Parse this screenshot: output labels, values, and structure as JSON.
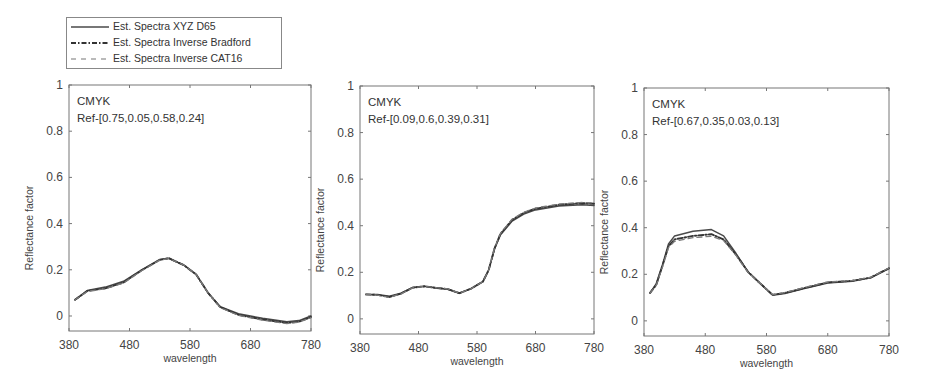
{
  "legend": {
    "entries": [
      {
        "label": "Est. Spectra XYZ D65",
        "style": "solid"
      },
      {
        "label": "Est. Spectra Inverse Bradford",
        "style": "dashdot"
      },
      {
        "label": "Est. Spectra Inverse CAT16",
        "style": "dashed"
      }
    ]
  },
  "colors": {
    "line": "#4a4a4a",
    "axis": "#777777",
    "text": "#444444"
  },
  "chart_data": [
    {
      "type": "line",
      "title": "",
      "annotation": [
        "CMYK",
        "Ref-[0.75,0.05,0.58,0.24]"
      ],
      "xlabel": "wavelength",
      "ylabel": "Reflectance factor",
      "xlim": [
        380,
        780
      ],
      "ylim": [
        -0.065,
        1
      ],
      "xticks": [
        380,
        480,
        580,
        680,
        780
      ],
      "yticks": [
        0,
        0.2,
        0.4,
        0.6,
        0.8,
        1
      ],
      "ytick_labels": [
        "0",
        "0.2",
        "0.4",
        "0.6",
        "0.8",
        "1"
      ],
      "grid": false,
      "frame": {
        "left": 69,
        "top": 85,
        "right": 311,
        "bottom": 331
      },
      "x": [
        390,
        410,
        440,
        470,
        500,
        530,
        545,
        570,
        590,
        610,
        630,
        660,
        700,
        740,
        760,
        780
      ],
      "series": [
        {
          "name": "Est. Spectra XYZ D65",
          "values": [
            0.07,
            0.11,
            0.125,
            0.15,
            0.2,
            0.245,
            0.25,
            0.22,
            0.18,
            0.1,
            0.04,
            0.01,
            -0.01,
            -0.025,
            -0.02,
            0.0
          ]
        },
        {
          "name": "Est. Spectra Inverse Bradford",
          "values": [
            0.07,
            0.108,
            0.12,
            0.145,
            0.198,
            0.243,
            0.25,
            0.22,
            0.18,
            0.1,
            0.038,
            0.005,
            -0.015,
            -0.03,
            -0.025,
            -0.005
          ]
        },
        {
          "name": "Est. Spectra Inverse CAT16",
          "values": [
            0.07,
            0.106,
            0.118,
            0.143,
            0.196,
            0.242,
            0.249,
            0.22,
            0.18,
            0.1,
            0.036,
            0.003,
            -0.018,
            -0.033,
            -0.027,
            -0.007
          ]
        }
      ]
    },
    {
      "type": "line",
      "title": "",
      "annotation": [
        "CMYK",
        "Ref-[0.09,0.6,0.39,0.31]"
      ],
      "xlabel": "wavelength",
      "ylabel": "Reflectance factor",
      "xlim": [
        380,
        780
      ],
      "ylim": [
        -0.065,
        1
      ],
      "xticks": [
        380,
        480,
        580,
        680,
        780
      ],
      "yticks": [
        0,
        0.2,
        0.4,
        0.6,
        0.8,
        1
      ],
      "ytick_labels": [
        "0",
        "0.2",
        "0.4",
        "0.6",
        "0.8",
        "1"
      ],
      "grid": false,
      "frame": {
        "left": 360,
        "top": 86,
        "right": 594,
        "bottom": 334
      },
      "x": [
        390,
        410,
        430,
        450,
        470,
        490,
        510,
        530,
        550,
        570,
        590,
        600,
        610,
        620,
        640,
        660,
        680,
        720,
        760,
        780
      ],
      "series": [
        {
          "name": "Est. Spectra XYZ D65",
          "values": [
            0.105,
            0.105,
            0.097,
            0.11,
            0.135,
            0.14,
            0.132,
            0.127,
            0.11,
            0.13,
            0.16,
            0.21,
            0.3,
            0.36,
            0.42,
            0.45,
            0.468,
            0.485,
            0.49,
            0.487
          ]
        },
        {
          "name": "Est. Spectra Inverse Bradford",
          "values": [
            0.105,
            0.103,
            0.094,
            0.108,
            0.134,
            0.14,
            0.133,
            0.128,
            0.11,
            0.13,
            0.16,
            0.21,
            0.302,
            0.365,
            0.425,
            0.455,
            0.473,
            0.49,
            0.497,
            0.494
          ]
        },
        {
          "name": "Est. Spectra Inverse CAT16",
          "values": [
            0.105,
            0.102,
            0.092,
            0.107,
            0.133,
            0.14,
            0.134,
            0.129,
            0.11,
            0.13,
            0.16,
            0.21,
            0.303,
            0.367,
            0.428,
            0.458,
            0.476,
            0.493,
            0.5,
            0.497
          ]
        }
      ]
    },
    {
      "type": "line",
      "title": "",
      "annotation": [
        "CMYK",
        "Ref-[0.67,0.35,0.03,0.13]"
      ],
      "xlabel": "wavelength",
      "ylabel": "Reflectance factor",
      "xlim": [
        380,
        780
      ],
      "ylim": [
        -0.065,
        1
      ],
      "xticks": [
        380,
        480,
        580,
        680,
        780
      ],
      "yticks": [
        0,
        0.2,
        0.4,
        0.6,
        0.8,
        1
      ],
      "ytick_labels": [
        "0",
        "0.2",
        "0.4",
        "0.6",
        "0.8",
        "1"
      ],
      "grid": false,
      "frame": {
        "left": 644,
        "top": 88,
        "right": 889,
        "bottom": 336
      },
      "x": [
        390,
        400,
        410,
        420,
        430,
        460,
        490,
        510,
        530,
        550,
        570,
        590,
        610,
        640,
        680,
        720,
        750,
        780
      ],
      "series": [
        {
          "name": "Est. Spectra XYZ D65",
          "values": [
            0.12,
            0.16,
            0.24,
            0.33,
            0.365,
            0.385,
            0.392,
            0.365,
            0.29,
            0.21,
            0.16,
            0.11,
            0.118,
            0.138,
            0.163,
            0.17,
            0.185,
            0.225
          ]
        },
        {
          "name": "Est. Spectra Inverse Bradford",
          "values": [
            0.12,
            0.155,
            0.235,
            0.32,
            0.35,
            0.365,
            0.372,
            0.35,
            0.285,
            0.21,
            0.16,
            0.112,
            0.12,
            0.14,
            0.165,
            0.172,
            0.186,
            0.226
          ]
        },
        {
          "name": "Est. Spectra Inverse CAT16",
          "values": [
            0.12,
            0.153,
            0.23,
            0.315,
            0.342,
            0.357,
            0.363,
            0.345,
            0.282,
            0.208,
            0.16,
            0.113,
            0.122,
            0.142,
            0.167,
            0.173,
            0.187,
            0.227
          ]
        }
      ]
    }
  ]
}
